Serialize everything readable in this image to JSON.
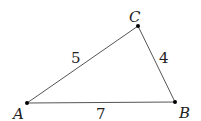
{
  "diagram": {
    "type": "triangle",
    "points": {
      "A": {
        "label": "A",
        "x": 27,
        "y": 103
      },
      "B": {
        "label": "B",
        "x": 175,
        "y": 102
      },
      "C": {
        "label": "C",
        "x": 138,
        "y": 26
      }
    },
    "sides": {
      "AC": {
        "label": "5"
      },
      "CB": {
        "label": "4"
      },
      "AB": {
        "label": "7"
      }
    },
    "colors": {
      "line": "#444444",
      "point": "#000000"
    }
  }
}
